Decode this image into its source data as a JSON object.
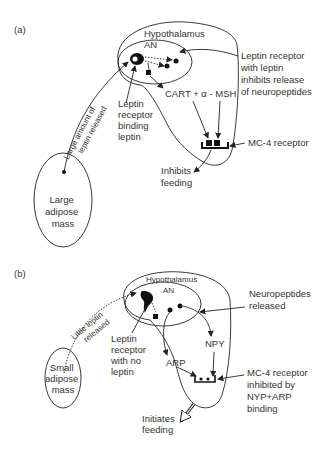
{
  "panel_a": {
    "label": "(a)",
    "hypothalamus": "Hypothalamus",
    "an": "AN",
    "receptor_callout": [
      "Leptin receptor",
      "with leptin",
      "inhibits release",
      "of neuropeptides"
    ],
    "binding_callout": [
      "Leptin",
      "receptor",
      "binding",
      "leptin"
    ],
    "peptides": "CART +  α - MSH",
    "mc4": "MC-4 receptor",
    "outcome": [
      "Inhibits",
      "feeding"
    ],
    "release_arrow": [
      "Large amount of",
      "leptin released"
    ],
    "adipose": [
      "Large",
      "adipose",
      "mass"
    ]
  },
  "panel_b": {
    "label": "(b)",
    "hypothalamus": "Hypothalamus",
    "an": "AN",
    "neuropeptides_callout": [
      "Neuropeptides",
      "released"
    ],
    "receptor_callout": [
      "Leptin",
      "receptor",
      "with no",
      "leptin"
    ],
    "npy": "NPY",
    "arp": "ARP",
    "mc4_callout": [
      "MC-4 receptor",
      "inhibited by",
      "NYP+ARP",
      "binding"
    ],
    "outcome": [
      "Initiates",
      "feeding"
    ],
    "release_arrow": [
      "Little leptin",
      "released"
    ],
    "adipose": [
      "Small",
      "adipose",
      "mass"
    ]
  }
}
